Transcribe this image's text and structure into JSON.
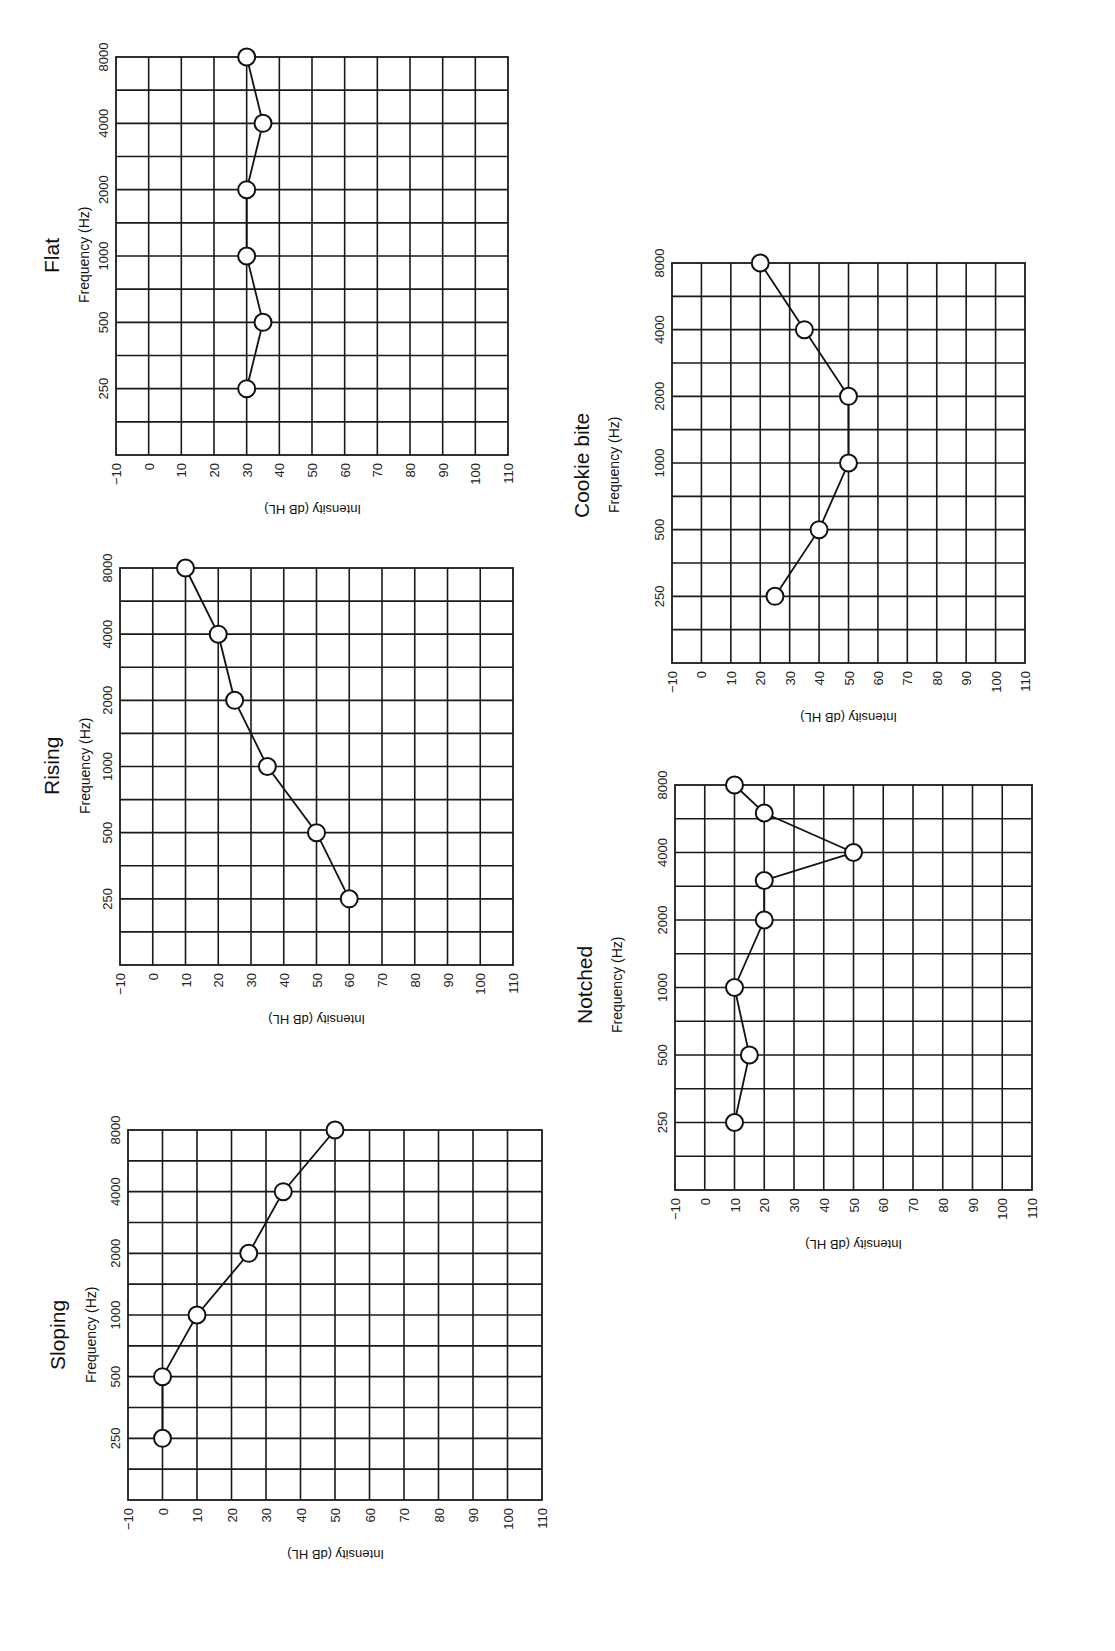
{
  "chart_data": [
    {
      "type": "line",
      "title": "Flat",
      "xlabel": "Frequency (Hz)",
      "ylabel": "Intensity (dB HL)",
      "x_ticks": [
        "250",
        "500",
        "1000",
        "2000",
        "4000",
        "8000"
      ],
      "y_ticks": [
        -10,
        0,
        10,
        20,
        30,
        40,
        50,
        60,
        70,
        80,
        90,
        100,
        110
      ],
      "ylim": [
        -10,
        110
      ],
      "grid": true,
      "series": [
        {
          "name": "threshold",
          "x": [
            250,
            500,
            1000,
            2000,
            4000,
            8000
          ],
          "values": [
            30,
            35,
            30,
            30,
            35,
            30
          ]
        }
      ]
    },
    {
      "type": "line",
      "title": "Rising",
      "xlabel": "Frequency (Hz)",
      "ylabel": "Intensity (dB HL)",
      "x_ticks": [
        "250",
        "500",
        "1000",
        "2000",
        "4000",
        "8000"
      ],
      "y_ticks": [
        -10,
        0,
        10,
        20,
        30,
        40,
        50,
        60,
        70,
        80,
        90,
        100,
        110
      ],
      "ylim": [
        -10,
        110
      ],
      "grid": true,
      "series": [
        {
          "name": "threshold",
          "x": [
            250,
            500,
            1000,
            2000,
            4000,
            8000
          ],
          "values": [
            60,
            50,
            35,
            25,
            20,
            10
          ]
        }
      ]
    },
    {
      "type": "line",
      "title": "Sloping",
      "xlabel": "Frequency (Hz)",
      "ylabel": "Intensity (dB HL)",
      "x_ticks": [
        "250",
        "500",
        "1000",
        "2000",
        "4000",
        "8000"
      ],
      "y_ticks": [
        -10,
        0,
        10,
        20,
        30,
        40,
        50,
        60,
        70,
        80,
        90,
        100,
        110
      ],
      "ylim": [
        -10,
        110
      ],
      "grid": true,
      "series": [
        {
          "name": "threshold",
          "x": [
            250,
            500,
            1000,
            2000,
            4000,
            8000
          ],
          "values": [
            0,
            0,
            10,
            25,
            35,
            50
          ]
        }
      ]
    },
    {
      "type": "line",
      "title": "Cookie bite",
      "xlabel": "Frequency (Hz)",
      "ylabel": "Intensity (dB HL)",
      "x_ticks": [
        "250",
        "500",
        "1000",
        "2000",
        "4000",
        "8000"
      ],
      "y_ticks": [
        -10,
        0,
        10,
        20,
        30,
        40,
        50,
        60,
        70,
        80,
        90,
        100,
        110
      ],
      "ylim": [
        -10,
        110
      ],
      "grid": true,
      "series": [
        {
          "name": "threshold",
          "x": [
            250,
            500,
            1000,
            2000,
            4000,
            8000
          ],
          "values": [
            25,
            40,
            50,
            50,
            35,
            20
          ]
        }
      ]
    },
    {
      "type": "line",
      "title": "Notched",
      "xlabel": "Frequency (Hz)",
      "ylabel": "Intensity (dB HL)",
      "x_ticks": [
        "250",
        "500",
        "1000",
        "2000",
        "4000",
        "8000"
      ],
      "y_ticks": [
        -10,
        0,
        10,
        20,
        30,
        40,
        50,
        60,
        70,
        80,
        90,
        100,
        110
      ],
      "ylim": [
        -10,
        110
      ],
      "grid": true,
      "series": [
        {
          "name": "threshold",
          "x": [
            250,
            500,
            1000,
            2000,
            3000,
            4000,
            6000,
            8000
          ],
          "values": [
            10,
            15,
            10,
            20,
            20,
            50,
            20,
            10
          ]
        }
      ]
    }
  ],
  "panels": [
    {
      "title": "Flat",
      "subtitle": "Frequency (Hz)",
      "ylabel": "Intensity (dB HL)"
    },
    {
      "title": "Rising",
      "subtitle": "Frequency (Hz)",
      "ylabel": "Intensity (dB HL)"
    },
    {
      "title": "Sloping",
      "subtitle": "Frequency (Hz)",
      "ylabel": "Intensity (dB HL)"
    },
    {
      "title": "Cookie bite",
      "subtitle": "Frequency (Hz)",
      "ylabel": "Intensity (dB HL)"
    },
    {
      "title": "Notched",
      "subtitle": "Frequency (Hz)",
      "ylabel": "Intensity (dB HL)"
    }
  ]
}
